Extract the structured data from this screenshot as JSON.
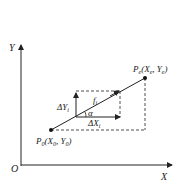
{
  "diagram": {
    "axes": {
      "x_label": "X",
      "y_label": "Y",
      "origin_label": "O"
    },
    "start_point": {
      "label_main": "P",
      "label_sub": "0",
      "coords": "(X",
      "coords_sub0": "0",
      "sep": ", Y",
      "coords_sub1": "0",
      "close": ")"
    },
    "end_point": {
      "label_main": "P",
      "label_sub": "e",
      "coords": "(X",
      "coords_sub0": "e",
      "sep": ", Y",
      "coords_sub1": "e",
      "close": ")"
    },
    "vector_label": {
      "main": "f",
      "sub": "i"
    },
    "delta_y": {
      "prefix": "ΔY",
      "sub": "i"
    },
    "delta_x": {
      "prefix": "ΔX",
      "sub": "i"
    },
    "angle_label": "α",
    "colors": {
      "line": "#222222",
      "background": "#ffffff"
    }
  }
}
